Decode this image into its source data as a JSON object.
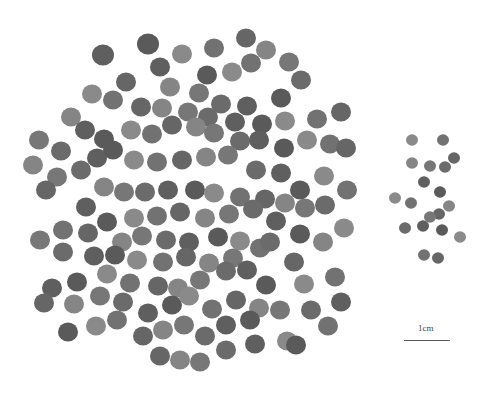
{
  "image": {
    "description": "Photograph of many round seeds (large cluster on left, small cluster on right) on white background with scale bar",
    "background": "#ffffff",
    "seed_color": "#6e6e6e"
  },
  "scale_bar": {
    "label": "1cm"
  },
  "large_seeds": [
    [
      103,
      55,
      11
    ],
    [
      148,
      44,
      11
    ],
    [
      182,
      54,
      10
    ],
    [
      214,
      48,
      10
    ],
    [
      246,
      38,
      10
    ],
    [
      266,
      50,
      10
    ],
    [
      289,
      62,
      10
    ],
    [
      301,
      80,
      10
    ],
    [
      160,
      67,
      10
    ],
    [
      207,
      75,
      10
    ],
    [
      232,
      72,
      10
    ],
    [
      251,
      63,
      10
    ],
    [
      126,
      82,
      10
    ],
    [
      170,
      87,
      10
    ],
    [
      199,
      93,
      10
    ],
    [
      221,
      104,
      10
    ],
    [
      247,
      106,
      10
    ],
    [
      281,
      98,
      10
    ],
    [
      92,
      94,
      10
    ],
    [
      113,
      100,
      10
    ],
    [
      141,
      107,
      10
    ],
    [
      162,
      108,
      10
    ],
    [
      188,
      112,
      10
    ],
    [
      208,
      117,
      10
    ],
    [
      235,
      122,
      10
    ],
    [
      262,
      124,
      10
    ],
    [
      285,
      121,
      10
    ],
    [
      317,
      119,
      10
    ],
    [
      341,
      112,
      10
    ],
    [
      71,
      117,
      10
    ],
    [
      39,
      140,
      10
    ],
    [
      61,
      151,
      10
    ],
    [
      85,
      130,
      10
    ],
    [
      104,
      139,
      10
    ],
    [
      131,
      130,
      10
    ],
    [
      152,
      134,
      10
    ],
    [
      172,
      125,
      10
    ],
    [
      196,
      127,
      10
    ],
    [
      214,
      133,
      10
    ],
    [
      240,
      141,
      10
    ],
    [
      259,
      140,
      10
    ],
    [
      284,
      148,
      10
    ],
    [
      307,
      140,
      10
    ],
    [
      330,
      144,
      10
    ],
    [
      346,
      148,
      10
    ],
    [
      33,
      165,
      10
    ],
    [
      57,
      177,
      10
    ],
    [
      81,
      170,
      10
    ],
    [
      97,
      158,
      10
    ],
    [
      113,
      150,
      10
    ],
    [
      134,
      160,
      10
    ],
    [
      157,
      162,
      10
    ],
    [
      182,
      160,
      10
    ],
    [
      206,
      157,
      10
    ],
    [
      228,
      155,
      10
    ],
    [
      256,
      170,
      10
    ],
    [
      281,
      173,
      10
    ],
    [
      300,
      190,
      10
    ],
    [
      324,
      176,
      10
    ],
    [
      347,
      190,
      10
    ],
    [
      46,
      190,
      10
    ],
    [
      104,
      187,
      10
    ],
    [
      124,
      192,
      10
    ],
    [
      145,
      192,
      10
    ],
    [
      168,
      190,
      10
    ],
    [
      195,
      190,
      10
    ],
    [
      214,
      193,
      10
    ],
    [
      240,
      197,
      10
    ],
    [
      265,
      199,
      10
    ],
    [
      285,
      203,
      10
    ],
    [
      305,
      208,
      10
    ],
    [
      325,
      205,
      10
    ],
    [
      86,
      207,
      10
    ],
    [
      107,
      222,
      10
    ],
    [
      134,
      218,
      10
    ],
    [
      157,
      216,
      10
    ],
    [
      180,
      212,
      10
    ],
    [
      205,
      218,
      10
    ],
    [
      229,
      214,
      10
    ],
    [
      253,
      209,
      10
    ],
    [
      276,
      221,
      10
    ],
    [
      300,
      234,
      10
    ],
    [
      344,
      228,
      10
    ],
    [
      63,
      230,
      10
    ],
    [
      88,
      233,
      10
    ],
    [
      122,
      242,
      10
    ],
    [
      142,
      236,
      10
    ],
    [
      166,
      240,
      10
    ],
    [
      189,
      242,
      10
    ],
    [
      218,
      237,
      10
    ],
    [
      240,
      241,
      10
    ],
    [
      260,
      248,
      10
    ],
    [
      294,
      262,
      10
    ],
    [
      323,
      242,
      10
    ],
    [
      40,
      240,
      10
    ],
    [
      63,
      252,
      10
    ],
    [
      94,
      256,
      10
    ],
    [
      115,
      255,
      10
    ],
    [
      137,
      260,
      10
    ],
    [
      163,
      262,
      10
    ],
    [
      186,
      257,
      10
    ],
    [
      209,
      263,
      10
    ],
    [
      233,
      258,
      10
    ],
    [
      270,
      242,
      10
    ],
    [
      52,
      288,
      10
    ],
    [
      77,
      282,
      10
    ],
    [
      107,
      274,
      10
    ],
    [
      130,
      283,
      10
    ],
    [
      158,
      286,
      10
    ],
    [
      178,
      288,
      10
    ],
    [
      200,
      280,
      10
    ],
    [
      226,
      271,
      10
    ],
    [
      247,
      270,
      10
    ],
    [
      266,
      285,
      10
    ],
    [
      304,
      284,
      10
    ],
    [
      335,
      277,
      10
    ],
    [
      44,
      303,
      10
    ],
    [
      74,
      304,
      10
    ],
    [
      100,
      296,
      10
    ],
    [
      123,
      302,
      10
    ],
    [
      148,
      313,
      10
    ],
    [
      172,
      305,
      10
    ],
    [
      189,
      296,
      10
    ],
    [
      212,
      309,
      10
    ],
    [
      236,
      300,
      10
    ],
    [
      259,
      308,
      10
    ],
    [
      280,
      310,
      10
    ],
    [
      311,
      310,
      10
    ],
    [
      341,
      302,
      10
    ],
    [
      68,
      332,
      10
    ],
    [
      96,
      326,
      10
    ],
    [
      117,
      320,
      10
    ],
    [
      143,
      336,
      10
    ],
    [
      163,
      330,
      10
    ],
    [
      184,
      325,
      10
    ],
    [
      205,
      336,
      10
    ],
    [
      226,
      325,
      10
    ],
    [
      250,
      320,
      10
    ],
    [
      287,
      341,
      10
    ],
    [
      328,
      326,
      10
    ],
    [
      160,
      356,
      10
    ],
    [
      180,
      360,
      10
    ],
    [
      200,
      362,
      10
    ],
    [
      226,
      350,
      10
    ],
    [
      255,
      344,
      10
    ],
    [
      296,
      345,
      10
    ]
  ],
  "small_seeds": [
    [
      412,
      140,
      6
    ],
    [
      443,
      140,
      6
    ],
    [
      454,
      158,
      6
    ],
    [
      412,
      163,
      6
    ],
    [
      430,
      166,
      6
    ],
    [
      445,
      167,
      6
    ],
    [
      424,
      182,
      6
    ],
    [
      440,
      192,
      6
    ],
    [
      395,
      198,
      6
    ],
    [
      411,
      203,
      6
    ],
    [
      439,
      214,
      6
    ],
    [
      449,
      206,
      6
    ],
    [
      430,
      217,
      6
    ],
    [
      405,
      228,
      6
    ],
    [
      423,
      226,
      6
    ],
    [
      442,
      230,
      6
    ],
    [
      460,
      237,
      6
    ],
    [
      424,
      255,
      6
    ],
    [
      438,
      258,
      6
    ]
  ]
}
